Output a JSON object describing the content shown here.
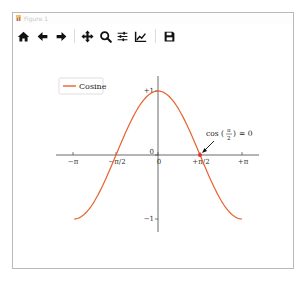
{
  "window": {
    "title": "Figure 1"
  },
  "toolbar": {
    "buttons": [
      {
        "name": "home",
        "icon": "home-icon",
        "tooltip": "Reset original view"
      },
      {
        "name": "back",
        "icon": "arrow-left-icon",
        "tooltip": "Back to previous view"
      },
      {
        "name": "forward",
        "icon": "arrow-right-icon",
        "tooltip": "Forward to next view"
      },
      {
        "name": "pan",
        "icon": "move-icon",
        "tooltip": "Pan axes"
      },
      {
        "name": "zoom",
        "icon": "magnifier-icon",
        "tooltip": "Zoom to rectangle"
      },
      {
        "name": "configure",
        "icon": "sliders-icon",
        "tooltip": "Configure subplots"
      },
      {
        "name": "edit",
        "icon": "line-chart-icon",
        "tooltip": "Edit axis, curve and image parameters"
      },
      {
        "name": "save",
        "icon": "floppy-icon",
        "tooltip": "Save the figure"
      }
    ]
  },
  "chart_data": {
    "type": "line",
    "title": "",
    "xlabel": "",
    "ylabel": "",
    "xlim": [
      -3.4,
      3.8
    ],
    "ylim": [
      -1.2,
      1.2
    ],
    "grid": false,
    "spines": "centered at origin",
    "legend": {
      "position": "upper left",
      "entries": [
        "Cosine"
      ]
    },
    "series": [
      {
        "name": "Cosine",
        "color": "#e8622d",
        "function": "cos(x)",
        "x_range": [
          -3.14159,
          3.14159
        ],
        "x": [
          -3.14159,
          -2.35619,
          -1.5708,
          -0.7854,
          0,
          0.7854,
          1.5708,
          2.35619,
          3.14159
        ],
        "values": [
          -1,
          -0.7071,
          0,
          0.7071,
          1,
          0.7071,
          0,
          -0.7071,
          -1
        ]
      }
    ],
    "x_ticks": [
      {
        "value": -3.14159,
        "label": "−π"
      },
      {
        "value": -1.5708,
        "label": "−π/2"
      },
      {
        "value": 0,
        "label": "0"
      },
      {
        "value": 1.5708,
        "label": "+π/2"
      },
      {
        "value": 3.14159,
        "label": "+π"
      }
    ],
    "y_ticks": [
      {
        "value": -1,
        "label": "−1"
      },
      {
        "value": 0,
        "label": "0"
      },
      {
        "value": 1,
        "label": "+1"
      }
    ],
    "annotations": [
      {
        "text_prefix": "cos",
        "fraction_num": "π",
        "fraction_den": "2",
        "text_suffix": "= 0",
        "point": [
          1.5708,
          0
        ],
        "marker_color": "#e8302d"
      }
    ]
  },
  "labels": {
    "legend_entry": "Cosine",
    "xtick_neg_pi": "−π",
    "xtick_neg_half_pi": "−π/2",
    "xtick_zero": "0",
    "xtick_pos_half_pi": "+π/2",
    "xtick_pos_pi": "+π",
    "ytick_pos_one": "+1",
    "ytick_zero": "0",
    "ytick_neg_one": "−1",
    "annot_prefix": "cos",
    "annot_open": "(",
    "annot_num": "π",
    "annot_den": "2",
    "annot_close": ")",
    "annot_suffix": "=  0"
  }
}
